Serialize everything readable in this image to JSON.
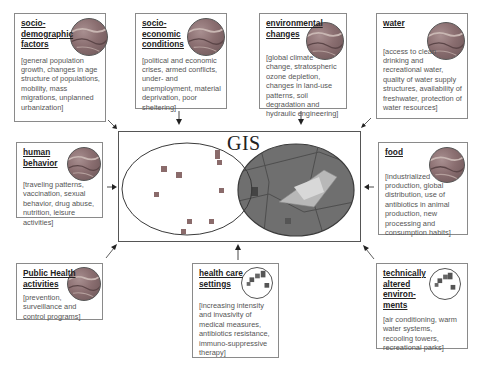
{
  "diagram": {
    "center": {
      "label": "GIS",
      "left_layer": "point-data-layer",
      "right_layer": "map-layer"
    },
    "factors": [
      {
        "id": "socio-demographic",
        "title": "socio-demographic factors",
        "title_lines": [
          "socio-",
          "demographic",
          "factors"
        ],
        "description": "[general population growth, changes in age structure of populations, mobility, mass migrations, unplanned urbanization]",
        "icon": "globe-map-icon"
      },
      {
        "id": "socio-economic",
        "title": "socio-economic conditions",
        "title_lines": [
          "socio-",
          "economic",
          "conditions"
        ],
        "description": "[political and economic crises, armed conflicts, under- and unemployment, material deprivation, poor sheltering]",
        "icon": "globe-map-icon"
      },
      {
        "id": "environmental",
        "title": "environmental changes",
        "title_lines": [
          "environmental",
          "changes"
        ],
        "description": "[global climate change, stratospheric ozone depletion, changes in land-use patterns, soil degradation and hydraulic engineering]",
        "icon": "globe-map-icon"
      },
      {
        "id": "water",
        "title": "water",
        "title_lines": [
          "water"
        ],
        "description": "[access to clean drinking and recreational water, quality of water supply structures, availability of freshwater, protection of water resources]",
        "icon": "globe-map-icon"
      },
      {
        "id": "human-behavior",
        "title": "human behavior",
        "title_lines": [
          "human",
          "behavior"
        ],
        "description": "[traveling patterns, vaccination, sexual behavior, drug abuse, nutrition, leisure activities]",
        "icon": "globe-map-icon"
      },
      {
        "id": "food",
        "title": "food",
        "title_lines": [
          "food"
        ],
        "description": "[industrialized production, global distribution, use of antibiotics in animal production, new processing and consumption habits]",
        "icon": "globe-map-icon"
      },
      {
        "id": "public-health",
        "title": "Public Health activities",
        "title_lines": [
          "Public Health",
          "activities"
        ],
        "description": "[prevention, surveillance and control programs]",
        "icon": "globe-map-icon"
      },
      {
        "id": "health-care",
        "title": "health care settings",
        "title_lines": [
          "health care",
          "settings"
        ],
        "description": "[increasing intensity and invasivity of medical measures, antibiotics resistance, immuno-suppressive therapy]",
        "icon": "point-cluster-icon"
      },
      {
        "id": "technical-env",
        "title": "technically altered environments",
        "title_lines": [
          "technically",
          "altered",
          "environ-",
          "ments"
        ],
        "description": "[air conditioning, warm water systems, recooling towers, recreational parks]",
        "icon": "point-cluster-icon"
      }
    ],
    "colors": {
      "box_border": "#8a8a8a",
      "text": "#333333",
      "globe_fill": "#8a6e70",
      "map_fill": "#6e6e6e",
      "point_fill": "#8a6b6b"
    }
  }
}
